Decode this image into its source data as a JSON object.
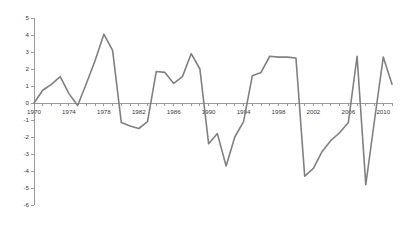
{
  "chart_data": {
    "type": "line",
    "title": "",
    "subtitle": "",
    "xlabel": "",
    "ylabel": "",
    "grid": false,
    "legend": false,
    "legend_position": "none",
    "line_color": "#808080",
    "axis_color": "#9a9a9a",
    "xlim": [
      1970,
      2011
    ],
    "ylim": [
      -6,
      5
    ],
    "y_ticks": [
      5,
      4,
      3,
      2,
      1,
      0,
      -1,
      -2,
      -3,
      -4,
      -5,
      -6
    ],
    "y_tick_labels": [
      "5",
      "4",
      "3",
      "2",
      "1",
      "0",
      "-1",
      "-2",
      "-3",
      "-4",
      "-5",
      "-6"
    ],
    "x_ticks": [
      1970,
      1974,
      1978,
      1982,
      1986,
      1990,
      1994,
      1998,
      2002,
      2006,
      2010
    ],
    "x_tick_labels": [
      "1970",
      "1974",
      "1978",
      "1982",
      "1986",
      "1990",
      "1994",
      "1998",
      "2002",
      "2006",
      "2010"
    ],
    "x_minor_tick_interval": 1,
    "x": [
      1970,
      1971,
      1972,
      1973,
      1974,
      1975,
      1976,
      1977,
      1978,
      1979,
      1980,
      1981,
      1982,
      1983,
      1984,
      1985,
      1986,
      1987,
      1988,
      1989,
      1990,
      1991,
      1992,
      1993,
      1994,
      1995,
      1996,
      1997,
      1998,
      1999,
      2000,
      2001,
      2002,
      2003,
      2004,
      2005,
      2006,
      2007,
      2008,
      2009,
      2010,
      2011
    ],
    "values": [
      0.0,
      0.75,
      1.1,
      1.55,
      0.55,
      -0.15,
      1.15,
      2.5,
      4.05,
      3.1,
      -1.15,
      -1.35,
      -1.5,
      -1.1,
      1.85,
      1.8,
      1.15,
      1.55,
      2.9,
      2.0,
      -2.4,
      -1.8,
      -3.7,
      -2.0,
      -1.1,
      1.6,
      1.8,
      2.75,
      2.7,
      2.7,
      2.65,
      -4.3,
      -3.85,
      -2.85,
      -2.2,
      -1.75,
      -1.15,
      2.75,
      -4.8,
      -1.0,
      2.7,
      1.1
    ],
    "series": [
      {
        "name": "series-1",
        "values": [
          0.0,
          0.75,
          1.1,
          1.55,
          0.55,
          -0.15,
          1.15,
          2.5,
          4.05,
          3.1,
          -1.15,
          -1.35,
          -1.5,
          -1.1,
          1.85,
          1.8,
          1.15,
          1.55,
          2.9,
          2.0,
          -2.4,
          -1.8,
          -3.7,
          -2.0,
          -1.1,
          1.6,
          1.8,
          2.75,
          2.7,
          2.7,
          2.65,
          -4.3,
          -3.85,
          -2.85,
          -2.2,
          -1.75,
          -1.15,
          2.75,
          -4.8,
          -1.0,
          2.7,
          1.1
        ]
      }
    ]
  },
  "geometry": {
    "plot_left": 34,
    "plot_right": 392,
    "y_top_px": 18,
    "y_bottom_px": 205,
    "zero_px": 112
  }
}
